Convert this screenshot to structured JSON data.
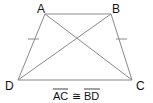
{
  "figure": {
    "type": "isosceles-trapezoid",
    "stroke_color": "#8a8a8a",
    "text_color": "#111111",
    "vertices": {
      "A": {
        "label": "A",
        "x": 45,
        "y": 14
      },
      "B": {
        "label": "B",
        "x": 111,
        "y": 14
      },
      "C": {
        "label": "C",
        "x": 132,
        "y": 80
      },
      "D": {
        "label": "D",
        "x": 18,
        "y": 80
      }
    },
    "segments": [
      "AB",
      "BC",
      "CD",
      "DA",
      "AC",
      "BD"
    ],
    "congruence_ticks": [
      "AD",
      "BC"
    ],
    "statement": {
      "left": "AC",
      "symbol": "≅",
      "right": "BD"
    }
  }
}
